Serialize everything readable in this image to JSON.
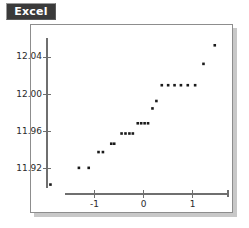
{
  "panel": {
    "badge_label": "Excel",
    "badge_bg": "#3a3a3a",
    "badge_fg": "#ffffff",
    "frame_color": "#8d8d8d",
    "shadow_color": "#c8c8c8",
    "background": "#ffffff"
  },
  "chart_data": {
    "type": "scatter",
    "title": "Excel",
    "subtitle": "",
    "xlabel": "",
    "ylabel": "",
    "grid": false,
    "legend": null,
    "axis_color": "#6f6f6f",
    "point_color": "#1a1a1a",
    "point_size_px": 2,
    "xlim": [
      -1.95,
      1.72
    ],
    "ylim": [
      11.895,
      12.063
    ],
    "xticks": [
      -1,
      0,
      1
    ],
    "xticklabels": [
      "-1",
      "0",
      "1"
    ],
    "yticks": [
      11.92,
      11.96,
      12.0,
      12.04
    ],
    "yticklabels": [
      "11.92",
      "11.96",
      "12.00",
      "12.04"
    ],
    "x": [
      -1.9,
      -1.32,
      -1.12,
      -0.92,
      -0.83,
      -0.66,
      -0.6,
      -0.45,
      -0.37,
      -0.29,
      -0.22,
      -0.12,
      -0.05,
      0.02,
      0.09,
      0.18,
      0.26,
      0.37,
      0.5,
      0.63,
      0.76,
      0.9,
      1.05,
      1.22,
      1.45
    ],
    "y": [
      11.903,
      11.921,
      11.921,
      11.938,
      11.938,
      11.947,
      11.947,
      11.958,
      11.958,
      11.958,
      11.958,
      11.969,
      11.969,
      11.969,
      11.969,
      11.985,
      11.993,
      12.01,
      12.01,
      12.01,
      12.01,
      12.01,
      12.01,
      12.033,
      12.053
    ]
  }
}
